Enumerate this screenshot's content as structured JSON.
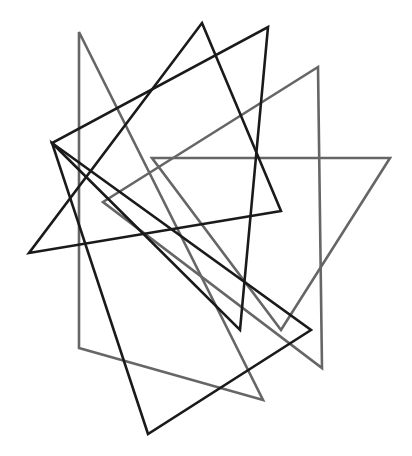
{
  "canvas": {
    "width": 412,
    "height": 456,
    "background": "#ffffff",
    "title": "Overlapping Triangles Figure"
  },
  "palette": {
    "dark": "#1a1a1a",
    "gray": "#666666",
    "background": "#ffffff"
  },
  "chart_data": {
    "type": "scatter",
    "title": "",
    "xlabel": "",
    "ylabel": "",
    "grid": false,
    "legend": "none",
    "xlim": [
      0,
      412
    ],
    "ylim": [
      0,
      456
    ],
    "shape_count": 6,
    "series": [
      {
        "name": "triangle-dark-1",
        "color": "#1a1a1a",
        "stroke_width": 2.6,
        "points": [
          [
            202,
            23
          ],
          [
            281,
            211
          ],
          [
            29,
            253
          ]
        ]
      },
      {
        "name": "triangle-dark-2",
        "color": "#1a1a1a",
        "stroke_width": 2.6,
        "points": [
          [
            268,
            27
          ],
          [
            240,
            330
          ],
          [
            52,
            143
          ]
        ]
      },
      {
        "name": "triangle-dark-3",
        "color": "#1a1a1a",
        "stroke_width": 2.6,
        "points": [
          [
            52,
            143
          ],
          [
            311,
            330
          ],
          [
            148,
            434
          ]
        ]
      },
      {
        "name": "triangle-gray-1",
        "color": "#666666",
        "stroke_width": 2.6,
        "points": [
          [
            79,
            32
          ],
          [
            263,
            400
          ],
          [
            79,
            348
          ]
        ]
      },
      {
        "name": "triangle-gray-2",
        "color": "#666666",
        "stroke_width": 2.6,
        "points": [
          [
            318,
            67
          ],
          [
            322,
            368
          ],
          [
            103,
            202
          ]
        ]
      },
      {
        "name": "triangle-gray-3",
        "color": "#666666",
        "stroke_width": 2.6,
        "points": [
          [
            152,
            158
          ],
          [
            390,
            158
          ],
          [
            281,
            330
          ]
        ]
      }
    ]
  }
}
